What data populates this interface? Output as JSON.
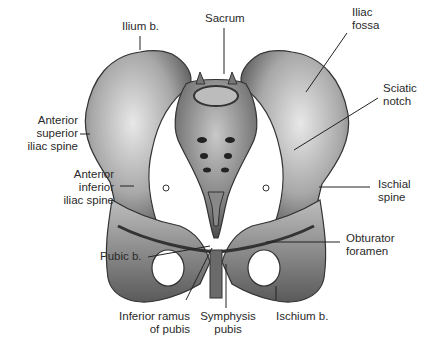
{
  "figure": {
    "labels": {
      "ilium": "Ilium b.",
      "sacrum": "Sacrum",
      "iliac_fossa": [
        "Iliac",
        "fossa"
      ],
      "sciatic_notch": [
        "Sciatic",
        "notch"
      ],
      "asis": [
        "Anterior",
        "superior",
        "iliac spine"
      ],
      "aiis": [
        "Anterior",
        "inferior",
        "iliac spine"
      ],
      "ischial_spine": [
        "Ischial",
        "spine"
      ],
      "obturator_foramen": [
        "Obturator",
        "foramen"
      ],
      "pubic": "Pubic b.",
      "inferior_ramus": [
        "Inferior ramus",
        "of pubis"
      ],
      "symphysis": [
        "Symphysis",
        "pubis"
      ],
      "ischium": "Ischium b."
    }
  },
  "colors": {
    "bone_light": "#d9d9d9",
    "bone_mid": "#9a9a9a",
    "bone_dark": "#4a4a4a",
    "line": "#222222"
  }
}
